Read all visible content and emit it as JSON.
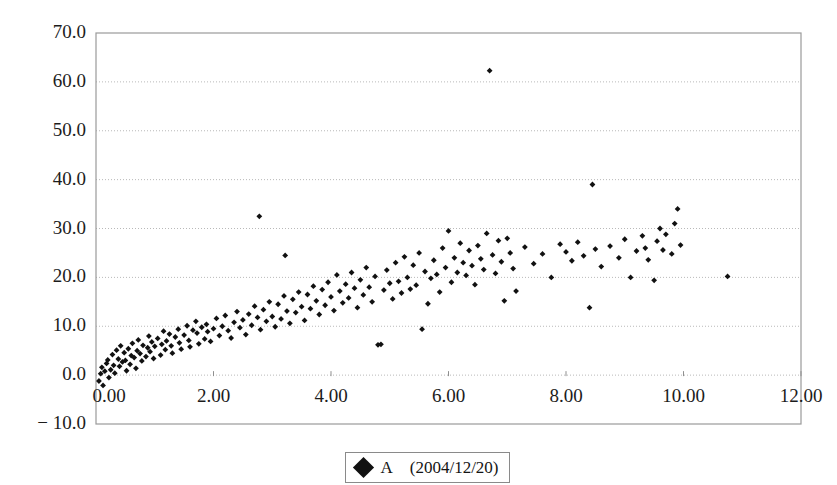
{
  "chart_data": {
    "type": "scatter",
    "title": "",
    "xlabel": "",
    "ylabel": "",
    "xlim": [
      0,
      12
    ],
    "ylim": [
      -10,
      70
    ],
    "grid": true,
    "grid_axis": "y",
    "legend_position": "bottom-center",
    "marker": "filled-diamond",
    "marker_color": "#111111",
    "xticks": [
      "0.00",
      "2.00",
      "4.00",
      "6.00",
      "8.00",
      "10.00",
      "12.00"
    ],
    "xtick_values": [
      0,
      2,
      4,
      6,
      8,
      10,
      12
    ],
    "yticks": [
      "70.0",
      "60.0",
      "50.0",
      "40.0",
      "30.0",
      "20.0",
      "10.0",
      "0.0",
      "− 10.0"
    ],
    "ytick_values": [
      70,
      60,
      50,
      40,
      30,
      20,
      10,
      0,
      -10
    ],
    "series": [
      {
        "name": "A (2004/12/20)",
        "marker": "filled-diamond",
        "color": "#111111",
        "points": [
          [
            0.05,
            -1.2
          ],
          [
            0.08,
            0.3
          ],
          [
            0.1,
            1.6
          ],
          [
            0.12,
            -2.1
          ],
          [
            0.15,
            0.8
          ],
          [
            0.18,
            2.4
          ],
          [
            0.2,
            3.1
          ],
          [
            0.22,
            -0.5
          ],
          [
            0.25,
            1.1
          ],
          [
            0.28,
            4.2
          ],
          [
            0.3,
            2.0
          ],
          [
            0.32,
            0.4
          ],
          [
            0.35,
            5.1
          ],
          [
            0.38,
            3.3
          ],
          [
            0.4,
            1.8
          ],
          [
            0.42,
            6.0
          ],
          [
            0.45,
            2.7
          ],
          [
            0.48,
            4.6
          ],
          [
            0.5,
            3.0
          ],
          [
            0.52,
            0.9
          ],
          [
            0.55,
            5.4
          ],
          [
            0.58,
            2.2
          ],
          [
            0.6,
            4.0
          ],
          [
            0.62,
            6.5
          ],
          [
            0.65,
            3.6
          ],
          [
            0.68,
            1.4
          ],
          [
            0.7,
            5.0
          ],
          [
            0.72,
            7.2
          ],
          [
            0.75,
            4.4
          ],
          [
            0.78,
            2.9
          ],
          [
            0.8,
            6.1
          ],
          [
            0.85,
            3.8
          ],
          [
            0.88,
            5.6
          ],
          [
            0.9,
            8.0
          ],
          [
            0.92,
            4.8
          ],
          [
            0.95,
            6.8
          ],
          [
            0.98,
            3.4
          ],
          [
            1.0,
            5.9
          ],
          [
            1.05,
            7.5
          ],
          [
            1.1,
            4.1
          ],
          [
            1.12,
            6.3
          ],
          [
            1.15,
            9.0
          ],
          [
            1.18,
            5.2
          ],
          [
            1.2,
            7.0
          ],
          [
            1.25,
            8.4
          ],
          [
            1.28,
            6.0
          ],
          [
            1.3,
            4.5
          ],
          [
            1.35,
            7.8
          ],
          [
            1.4,
            9.4
          ],
          [
            1.42,
            6.6
          ],
          [
            1.45,
            5.3
          ],
          [
            1.5,
            8.2
          ],
          [
            1.55,
            10.1
          ],
          [
            1.58,
            7.1
          ],
          [
            1.6,
            5.8
          ],
          [
            1.65,
            9.2
          ],
          [
            1.7,
            11.0
          ],
          [
            1.72,
            8.6
          ],
          [
            1.75,
            6.4
          ],
          [
            1.8,
            9.8
          ],
          [
            1.85,
            7.4
          ],
          [
            1.88,
            10.4
          ],
          [
            1.9,
            8.9
          ],
          [
            1.95,
            6.9
          ],
          [
            2.0,
            9.5
          ],
          [
            2.05,
            11.6
          ],
          [
            2.1,
            8.1
          ],
          [
            2.15,
            10.0
          ],
          [
            2.2,
            12.2
          ],
          [
            2.25,
            9.1
          ],
          [
            2.3,
            7.6
          ],
          [
            2.35,
            10.8
          ],
          [
            2.4,
            13.0
          ],
          [
            2.45,
            9.7
          ],
          [
            2.5,
            11.3
          ],
          [
            2.55,
            8.3
          ],
          [
            2.6,
            12.5
          ],
          [
            2.65,
            10.2
          ],
          [
            2.7,
            14.1
          ],
          [
            2.75,
            11.8
          ],
          [
            2.78,
            32.5
          ],
          [
            2.8,
            9.3
          ],
          [
            2.85,
            13.4
          ],
          [
            2.9,
            11.0
          ],
          [
            2.95,
            15.0
          ],
          [
            3.0,
            12.0
          ],
          [
            3.05,
            9.9
          ],
          [
            3.1,
            14.5
          ],
          [
            3.15,
            11.5
          ],
          [
            3.2,
            16.2
          ],
          [
            3.22,
            24.5
          ],
          [
            3.25,
            13.1
          ],
          [
            3.3,
            10.6
          ],
          [
            3.35,
            15.5
          ],
          [
            3.4,
            12.8
          ],
          [
            3.45,
            17.0
          ],
          [
            3.5,
            14.0
          ],
          [
            3.55,
            11.2
          ],
          [
            3.6,
            16.5
          ],
          [
            3.65,
            13.6
          ],
          [
            3.7,
            18.2
          ],
          [
            3.75,
            15.2
          ],
          [
            3.8,
            12.4
          ],
          [
            3.85,
            17.5
          ],
          [
            3.9,
            14.3
          ],
          [
            3.95,
            19.0
          ],
          [
            4.0,
            16.0
          ],
          [
            4.05,
            13.2
          ],
          [
            4.1,
            20.5
          ],
          [
            4.15,
            17.2
          ],
          [
            4.2,
            14.8
          ],
          [
            4.25,
            18.6
          ],
          [
            4.3,
            15.8
          ],
          [
            4.35,
            21.0
          ],
          [
            4.4,
            17.8
          ],
          [
            4.45,
            13.8
          ],
          [
            4.5,
            19.5
          ],
          [
            4.55,
            16.4
          ],
          [
            4.6,
            22.0
          ],
          [
            4.65,
            18.0
          ],
          [
            4.7,
            15.0
          ],
          [
            4.75,
            20.2
          ],
          [
            4.8,
            6.2
          ],
          [
            4.85,
            6.3
          ],
          [
            4.9,
            17.4
          ],
          [
            4.95,
            21.5
          ],
          [
            5.0,
            18.8
          ],
          [
            5.05,
            15.6
          ],
          [
            5.1,
            23.0
          ],
          [
            5.15,
            19.2
          ],
          [
            5.2,
            16.8
          ],
          [
            5.25,
            24.2
          ],
          [
            5.3,
            20.0
          ],
          [
            5.35,
            17.6
          ],
          [
            5.4,
            22.5
          ],
          [
            5.45,
            18.4
          ],
          [
            5.5,
            25.0
          ],
          [
            5.55,
            9.4
          ],
          [
            5.6,
            21.2
          ],
          [
            5.65,
            14.6
          ],
          [
            5.7,
            19.8
          ],
          [
            5.75,
            23.5
          ],
          [
            5.8,
            20.6
          ],
          [
            5.85,
            17.0
          ],
          [
            5.9,
            26.0
          ],
          [
            5.95,
            22.0
          ],
          [
            6.0,
            29.5
          ],
          [
            6.05,
            19.0
          ],
          [
            6.1,
            24.0
          ],
          [
            6.15,
            21.0
          ],
          [
            6.2,
            27.0
          ],
          [
            6.25,
            23.0
          ],
          [
            6.3,
            20.4
          ],
          [
            6.35,
            25.5
          ],
          [
            6.4,
            22.4
          ],
          [
            6.45,
            18.5
          ],
          [
            6.5,
            26.5
          ],
          [
            6.55,
            23.8
          ],
          [
            6.6,
            21.6
          ],
          [
            6.65,
            29.0
          ],
          [
            6.7,
            62.3
          ],
          [
            6.75,
            24.6
          ],
          [
            6.8,
            20.8
          ],
          [
            6.85,
            27.5
          ],
          [
            6.9,
            23.2
          ],
          [
            6.95,
            15.2
          ],
          [
            7.0,
            28.0
          ],
          [
            7.05,
            25.0
          ],
          [
            7.1,
            21.8
          ],
          [
            7.15,
            17.2
          ],
          [
            7.3,
            26.2
          ],
          [
            7.45,
            22.8
          ],
          [
            7.6,
            24.8
          ],
          [
            7.75,
            20.0
          ],
          [
            7.9,
            26.8
          ],
          [
            8.0,
            25.2
          ],
          [
            8.1,
            23.4
          ],
          [
            8.2,
            27.2
          ],
          [
            8.3,
            24.4
          ],
          [
            8.4,
            13.8
          ],
          [
            8.45,
            39.0
          ],
          [
            8.5,
            25.8
          ],
          [
            8.6,
            22.2
          ],
          [
            8.75,
            26.4
          ],
          [
            8.9,
            24.0
          ],
          [
            9.0,
            27.8
          ],
          [
            9.1,
            20.0
          ],
          [
            9.2,
            25.4
          ],
          [
            9.3,
            28.5
          ],
          [
            9.35,
            26.0
          ],
          [
            9.4,
            23.6
          ],
          [
            9.5,
            19.4
          ],
          [
            9.55,
            27.4
          ],
          [
            9.6,
            30.0
          ],
          [
            9.65,
            25.6
          ],
          [
            9.7,
            28.8
          ],
          [
            9.8,
            24.8
          ],
          [
            9.85,
            31.0
          ],
          [
            9.9,
            34.0
          ],
          [
            9.95,
            26.6
          ],
          [
            10.75,
            20.2
          ]
        ]
      }
    ]
  },
  "legend": {
    "marker_name": "filled-diamond-marker",
    "label": "A (2004/12/20)"
  }
}
